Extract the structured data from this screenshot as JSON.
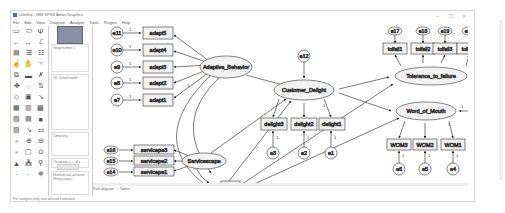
{
  "window": {
    "title": "Untitled - IBM SPSS Amos Graphics",
    "controls": [
      "minimize",
      "maximize",
      "close"
    ]
  },
  "menu": [
    "File",
    "Edit",
    "View",
    "Diagram",
    "Analyze",
    "Tools",
    "Plugins",
    "Help"
  ],
  "toolbox_icons": [
    "rectangle-icon",
    "ellipse-icon",
    "latent-indicator-icon",
    "arrow-icon",
    "double-arrow-icon",
    "error-term-icon",
    "title-icon",
    "variables-list-icon",
    "data-variables-icon",
    "select-one-icon",
    "select-all-icon",
    "deselect-icon",
    "duplicate-icon",
    "move-icon",
    "erase-icon",
    "shape-icon",
    "rotate-icon",
    "reflect-icon",
    "move-params-icon",
    "scroll-icon",
    "touch-up-icon",
    "data-file-icon",
    "analysis-props-icon",
    "calculate-icon",
    "copy-icon",
    "view-text-icon",
    "save-icon",
    "object-props-icon",
    "drag-props-icon",
    "preserve-symmetry-icon",
    "zoom-area-icon",
    "zoom-in-icon",
    "zoom-out-icon",
    "show-page-icon",
    "fit-page-icon",
    "loupe-icon",
    "bayesian-icon",
    "multigroup-icon",
    "print-icon",
    "undo-icon",
    "redo-icon",
    "specification-search-icon"
  ],
  "side_panel": {
    "group": "Group number 1",
    "model": "OK: Default model",
    "messages": "Computing ... ",
    "chi_square": "Chi-square = ..., df = ...",
    "notes": "Minimum was achieved. Writing output..."
  },
  "tabs": [
    "Path diagram",
    "Tables"
  ],
  "status": "For analysis only, use defined estimates",
  "diagram": {
    "latents": [
      "Adaptive_Behavior",
      "Servicescape",
      "Customer_Delight",
      "Tolerance_to_failure",
      "Word_of_Mouth"
    ],
    "observed": {
      "adapt": [
        "adapt5",
        "adapt4",
        "adapt3",
        "adapt2",
        "adapt1"
      ],
      "servicescape": [
        "servicape3",
        "servicape2",
        "servicape1"
      ],
      "delight": [
        "delight3",
        "delight2",
        "delight1"
      ],
      "tolfail": [
        "tolfail1",
        "tolfail2",
        "tolfail3",
        "tolfail4"
      ],
      "wom": [
        "WOM3",
        "WOM2",
        "WOM1"
      ],
      "age": "Age"
    },
    "errors": {
      "adapt": [
        "e11",
        "e10",
        "e9",
        "e8",
        "e7"
      ],
      "servicescape": [
        "e16",
        "e15",
        "e14"
      ],
      "delight": [
        "e3",
        "e2",
        "e1"
      ],
      "tolfail": [
        "e17",
        "e18",
        "e19",
        "e20"
      ],
      "wom": [
        "e6",
        "e5",
        "e4"
      ],
      "customer_delight": "e12",
      "tolerance": "e21",
      "word_of_mouth": "e13"
    },
    "fixed_weight": "1"
  }
}
